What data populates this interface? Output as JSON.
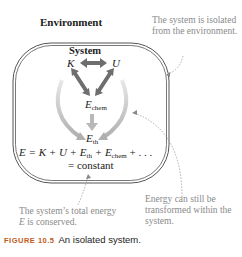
{
  "labels": {
    "environment": "Environment",
    "system": "System",
    "K": "K",
    "U": "U",
    "E_chem_main": "E",
    "E_chem_sub": "chem",
    "E_th_main": "E",
    "E_th_sub": "th"
  },
  "equation": {
    "line1_prefix": "E = K + U + E",
    "th_sub": "th",
    "middle": " + E",
    "chem_sub": "chem",
    "suffix": " + . . .",
    "line2": "= constant"
  },
  "annotations": {
    "isolated": "The system is isolated from the environment.",
    "transformed": "Energy can still be transformed within the system.",
    "conserved_a": "The system’s total energy ",
    "conserved_E": "E",
    "conserved_b": " is conserved."
  },
  "caption": {
    "figure_number": "FIGURE 10.5",
    "text": "An isolated system."
  },
  "colors": {
    "boundary": "#555555",
    "arrow_dark": "#6e6e6e",
    "arrow_light": "#b8b8b8",
    "note_text": "#8a8a8a",
    "figure_label": "#c05a1a"
  }
}
